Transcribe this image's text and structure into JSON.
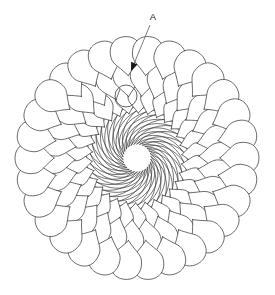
{
  "figure": {
    "kind": "line-drawing",
    "background_color": "#ffffff",
    "line_color": "#3a3a3a",
    "canvas": {
      "width": 275,
      "height": 295
    }
  },
  "callouts": [
    {
      "id": "callout-a",
      "label": "A",
      "label_x": 153,
      "label_y": 20,
      "leader_from": {
        "x": 150,
        "y": 25
      },
      "leader_to": {
        "x": 131,
        "y": 71
      },
      "arrow_angle_deg": 112,
      "points_to": "feather-spine-convergence-hub"
    }
  ],
  "wreath": {
    "center_x": 137,
    "center_y": 158,
    "outer_radius": 124,
    "inner_radius": 45,
    "plume_count": 30,
    "start_angle_deg": -104,
    "sweep_deg": 360,
    "spiral_twist_deg": 54,
    "plume_rows": 3,
    "rotation_direction": "clockwise",
    "hub": {
      "center_x": 126,
      "center_y": 96,
      "radius": 11
    },
    "row_specs": [
      {
        "name": "outer-row",
        "r_base": 83,
        "r_tip": 122,
        "lobe_width": 15.5,
        "count": 30
      },
      {
        "name": "middle-row",
        "r_base": 62,
        "r_tip": 97,
        "lobe_width": 13.0,
        "count": 30
      },
      {
        "name": "inner-row",
        "r_base": 45,
        "r_tip": 74,
        "lobe_width": 11.0,
        "count": 30
      }
    ],
    "spine_specs": [
      {
        "name": "spine-outer",
        "r_start": 14,
        "r_end": 120,
        "twist_deg": 150,
        "count": 30
      },
      {
        "name": "spine-inner",
        "r_start": 14,
        "r_end": 72,
        "twist_deg": 150,
        "count": 30
      }
    ]
  },
  "colors": {
    "stroke": "#3a3a3a",
    "fill": "#ffffff",
    "leader": "#5c5c66",
    "text": "#1a1a1a"
  }
}
